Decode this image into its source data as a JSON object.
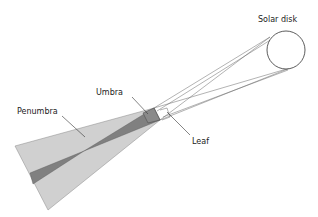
{
  "diagram": {
    "labels": {
      "solar_disk": "Solar disk",
      "umbra": "Umbra",
      "penumbra": "Penumbra",
      "leaf": "Leaf"
    },
    "colors": {
      "penumbra_fill": "#d0d0d0",
      "umbra_fill": "#808080",
      "leaf_fill": "#8a8a8a",
      "line": "#555555",
      "background": "#ffffff"
    }
  }
}
